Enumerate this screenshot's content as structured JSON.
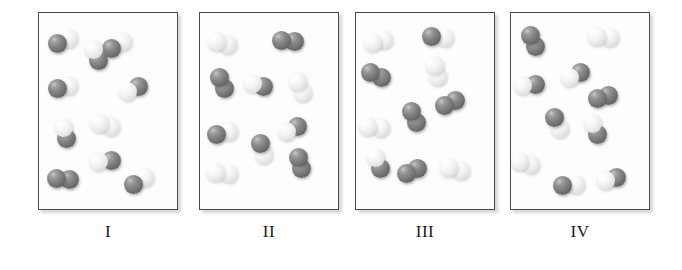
{
  "figure": {
    "background_color": "#ffffff",
    "atom_colors": {
      "dark": "#757575",
      "light": "#f0f0f0"
    },
    "panel_border_color": "#4a4a4a",
    "label_color": "#1a1a1a"
  },
  "panels": [
    {
      "label": "I",
      "x": 38,
      "counts": {
        "dark_dark": 1,
        "light_light": 0,
        "dark_light": 7,
        "total": 8
      },
      "molecules": [
        {
          "x": 24,
          "y": 28,
          "angle": -22,
          "a": "dark",
          "b": "light",
          "r": 9.5
        },
        {
          "x": 78,
          "y": 32,
          "angle": -34,
          "a": "dark",
          "b": "light",
          "r": 9.5
        },
        {
          "x": 57,
          "y": 42,
          "angle": 62,
          "a": "light",
          "b": "dark",
          "r": 9.5
        },
        {
          "x": 24,
          "y": 74,
          "angle": -12,
          "a": "dark",
          "b": "light",
          "r": 9.5
        },
        {
          "x": 94,
          "y": 76,
          "angle": -20,
          "a": "light",
          "b": "dark",
          "r": 9.5
        },
        {
          "x": 26,
          "y": 120,
          "angle": 78,
          "a": "light",
          "b": "dark",
          "r": 9.5
        },
        {
          "x": 66,
          "y": 112,
          "angle": 18,
          "a": "light",
          "b": "light",
          "r": 9.5
        },
        {
          "x": 66,
          "y": 148,
          "angle": -6,
          "a": "light",
          "b": "dark",
          "r": 9.5
        },
        {
          "x": 24,
          "y": 166,
          "angle": 4,
          "a": "dark",
          "b": "dark",
          "r": 9.5
        },
        {
          "x": 100,
          "y": 168,
          "angle": -32,
          "a": "dark",
          "b": "light",
          "r": 9.5
        }
      ]
    },
    {
      "label": "II",
      "x": 199,
      "counts": {
        "dark_dark": 4,
        "light_light": 2,
        "dark_light": 4,
        "total": 10
      },
      "molecules": [
        {
          "x": 22,
          "y": 30,
          "angle": 14,
          "a": "light",
          "b": "light",
          "r": 9.5
        },
        {
          "x": 88,
          "y": 28,
          "angle": 2,
          "a": "dark",
          "b": "dark",
          "r": 9.5
        },
        {
          "x": 22,
          "y": 70,
          "angle": 66,
          "a": "dark",
          "b": "dark",
          "r": 9.5
        },
        {
          "x": 58,
          "y": 72,
          "angle": 12,
          "a": "light",
          "b": "dark",
          "r": 9.5
        },
        {
          "x": 100,
          "y": 74,
          "angle": 70,
          "a": "light",
          "b": "light",
          "r": 9.5
        },
        {
          "x": 22,
          "y": 120,
          "angle": -10,
          "a": "dark",
          "b": "light",
          "r": 9.5
        },
        {
          "x": 92,
          "y": 116,
          "angle": -22,
          "a": "light",
          "b": "dark",
          "r": 9.5
        },
        {
          "x": 62,
          "y": 136,
          "angle": 74,
          "a": "dark",
          "b": "light",
          "r": 9.5
        },
        {
          "x": 100,
          "y": 150,
          "angle": 72,
          "a": "dark",
          "b": "dark",
          "r": 9.5
        },
        {
          "x": 22,
          "y": 160,
          "angle": 4,
          "a": "light",
          "b": "light",
          "r": 9.5
        }
      ]
    },
    {
      "label": "III",
      "x": 355,
      "counts": {
        "dark_dark": 4,
        "light_light": 3,
        "dark_light": 3,
        "total": 10
      },
      "molecules": [
        {
          "x": 22,
          "y": 28,
          "angle": -16,
          "a": "light",
          "b": "light",
          "r": 9.5
        },
        {
          "x": 82,
          "y": 24,
          "angle": 6,
          "a": "dark",
          "b": "light",
          "r": 9.5
        },
        {
          "x": 20,
          "y": 62,
          "angle": 24,
          "a": "dark",
          "b": "dark",
          "r": 9.5
        },
        {
          "x": 80,
          "y": 58,
          "angle": 76,
          "a": "light",
          "b": "light",
          "r": 9.5
        },
        {
          "x": 94,
          "y": 90,
          "angle": -24,
          "a": "dark",
          "b": "dark",
          "r": 9.5
        },
        {
          "x": 18,
          "y": 114,
          "angle": 4,
          "a": "light",
          "b": "light",
          "r": 9.5
        },
        {
          "x": 58,
          "y": 104,
          "angle": 66,
          "a": "dark",
          "b": "dark",
          "r": 9.5
        },
        {
          "x": 22,
          "y": 150,
          "angle": 64,
          "a": "light",
          "b": "dark",
          "r": 9.5
        },
        {
          "x": 56,
          "y": 158,
          "angle": -24,
          "a": "dark",
          "b": "dark",
          "r": 9.5
        },
        {
          "x": 98,
          "y": 156,
          "angle": 10,
          "a": "light",
          "b": "light",
          "r": 9.5
        }
      ]
    },
    {
      "label": "IV",
      "x": 510,
      "counts": {
        "dark_dark": 3,
        "light_light": 2,
        "dark_light": 5,
        "total": 10
      },
      "molecules": [
        {
          "x": 22,
          "y": 28,
          "angle": 70,
          "a": "dark",
          "b": "dark",
          "r": 9.5
        },
        {
          "x": 92,
          "y": 24,
          "angle": 2,
          "a": "light",
          "b": "light",
          "r": 9.5
        },
        {
          "x": 18,
          "y": 72,
          "angle": -4,
          "a": "light",
          "b": "dark",
          "r": 9.5
        },
        {
          "x": 64,
          "y": 62,
          "angle": -20,
          "a": "light",
          "b": "dark",
          "r": 9.5
        },
        {
          "x": 92,
          "y": 84,
          "angle": -18,
          "a": "dark",
          "b": "dark",
          "r": 9.5
        },
        {
          "x": 46,
          "y": 110,
          "angle": 68,
          "a": "dark",
          "b": "light",
          "r": 9.5
        },
        {
          "x": 84,
          "y": 116,
          "angle": 70,
          "a": "light",
          "b": "dark",
          "r": 9.5
        },
        {
          "x": 14,
          "y": 150,
          "angle": 14,
          "a": "light",
          "b": "light",
          "r": 9.5
        },
        {
          "x": 58,
          "y": 172,
          "angle": -6,
          "a": "dark",
          "b": "light",
          "r": 9.5
        },
        {
          "x": 100,
          "y": 166,
          "angle": -18,
          "a": "light",
          "b": "dark",
          "r": 9.5
        }
      ]
    }
  ]
}
